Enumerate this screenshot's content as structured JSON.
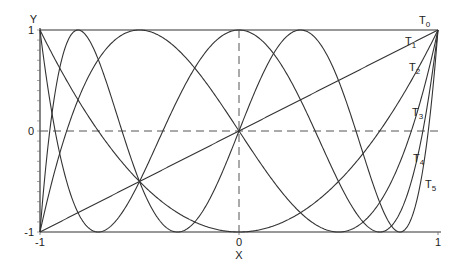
{
  "chart_data": {
    "type": "line",
    "title": "",
    "xlabel": "X",
    "ylabel": "Y",
    "xlim": [
      -1,
      1
    ],
    "ylim": [
      -1,
      1
    ],
    "x_ticks": [
      "-1",
      "0",
      "1"
    ],
    "y_ticks": [
      "-1",
      "0",
      "1"
    ],
    "grid": "dashed lines at x=0 and y=0",
    "legend": "inline labels at right end of curves",
    "series": [
      {
        "name": "T0",
        "label": "T",
        "sub": "0",
        "formula": "1",
        "degree": 0
      },
      {
        "name": "T1",
        "label": "T",
        "sub": "1",
        "formula": "x",
        "degree": 1
      },
      {
        "name": "T2",
        "label": "T",
        "sub": "2",
        "formula": "2x^2-1",
        "degree": 2
      },
      {
        "name": "T3",
        "label": "T",
        "sub": "3",
        "formula": "4x^3-3x",
        "degree": 3
      },
      {
        "name": "T4",
        "label": "T",
        "sub": "4",
        "formula": "8x^4-8x^2+1",
        "degree": 4
      },
      {
        "name": "T5",
        "label": "T",
        "sub": "5",
        "formula": "16x^5-20x^3+5x",
        "degree": 5
      }
    ]
  }
}
